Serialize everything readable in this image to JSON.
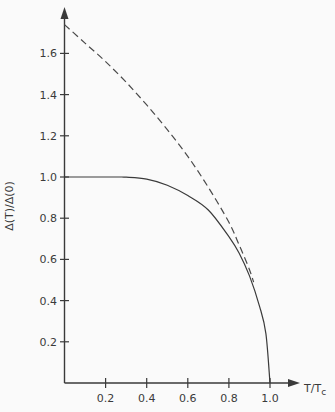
{
  "chart_data": {
    "type": "line",
    "title": "",
    "xlabel": "T/T_c",
    "ylabel": "Δ(T)/Δ(0)",
    "xlim": [
      0,
      1.0
    ],
    "ylim": [
      0,
      1.75
    ],
    "grid": false,
    "legend": null,
    "x_ticks": [
      "0.2",
      "0.4",
      "0.6",
      "0.8",
      "1.0"
    ],
    "y_ticks": [
      "0.2",
      "0.4",
      "0.6",
      "0.8",
      "1.0",
      "1.2",
      "1.4",
      "1.6"
    ],
    "series": [
      {
        "name": "BCS gap (solid)",
        "style": "solid",
        "x": [
          0.0,
          0.25,
          0.3,
          0.4,
          0.5,
          0.6,
          0.7,
          0.8,
          0.85,
          0.9,
          0.95,
          0.98,
          1.0
        ],
        "y": [
          1.0,
          1.0,
          0.999,
          0.99,
          0.96,
          0.91,
          0.84,
          0.71,
          0.63,
          0.52,
          0.37,
          0.24,
          0.0
        ]
      },
      {
        "name": "1.74(1 - T/Tc)^1/2 (dashed)",
        "style": "dashed",
        "x": [
          0.0,
          0.1,
          0.2,
          0.3,
          0.4,
          0.5,
          0.6,
          0.7,
          0.8,
          0.85,
          0.9,
          0.92
        ],
        "y": [
          1.74,
          1.65,
          1.56,
          1.46,
          1.35,
          1.23,
          1.1,
          0.95,
          0.78,
          0.67,
          0.55,
          0.49
        ]
      }
    ]
  },
  "axes": {
    "x_title_main": "T/T",
    "x_title_sub": "c",
    "y_title": "Δ(T)/Δ(0)"
  }
}
